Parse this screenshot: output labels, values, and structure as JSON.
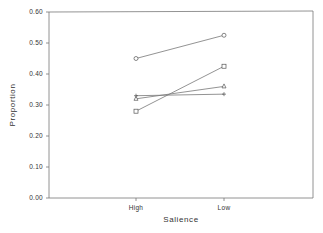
{
  "chart_data": {
    "type": "line",
    "title": "",
    "xlabel": "Salience",
    "ylabel": "Proportion",
    "categories": [
      "High",
      "Low"
    ],
    "ylim": [
      0.0,
      0.6
    ],
    "yticks": [
      "0.00",
      "0.10",
      "0.20",
      "0.30",
      "0.40",
      "0.50",
      "0.60"
    ],
    "grid": false,
    "legend": null,
    "series": [
      {
        "name": "circle",
        "marker": "circle",
        "values": [
          0.45,
          0.525
        ]
      },
      {
        "name": "square",
        "marker": "square",
        "values": [
          0.28,
          0.425
        ]
      },
      {
        "name": "triangle",
        "marker": "triangle",
        "values": [
          0.32,
          0.36
        ]
      },
      {
        "name": "plus",
        "marker": "plus",
        "values": [
          0.33,
          0.335
        ]
      }
    ]
  }
}
